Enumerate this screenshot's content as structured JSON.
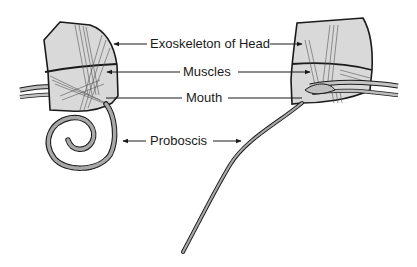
{
  "diagram": {
    "colors": {
      "outline": "#1a1a1a",
      "fill": "#d9d9d9",
      "muscle": "#555555",
      "proboscis_fill": "#a8a8a8",
      "text": "#1a1a1a"
    },
    "labels": {
      "exoskeleton": "Exoskeleton of Head",
      "muscles": "Muscles",
      "mouth": "Mouth",
      "proboscis": "Proboscis"
    },
    "figures": [
      {
        "id": "left",
        "state": "proboscis coiled"
      },
      {
        "id": "right",
        "state": "proboscis extended"
      }
    ]
  }
}
